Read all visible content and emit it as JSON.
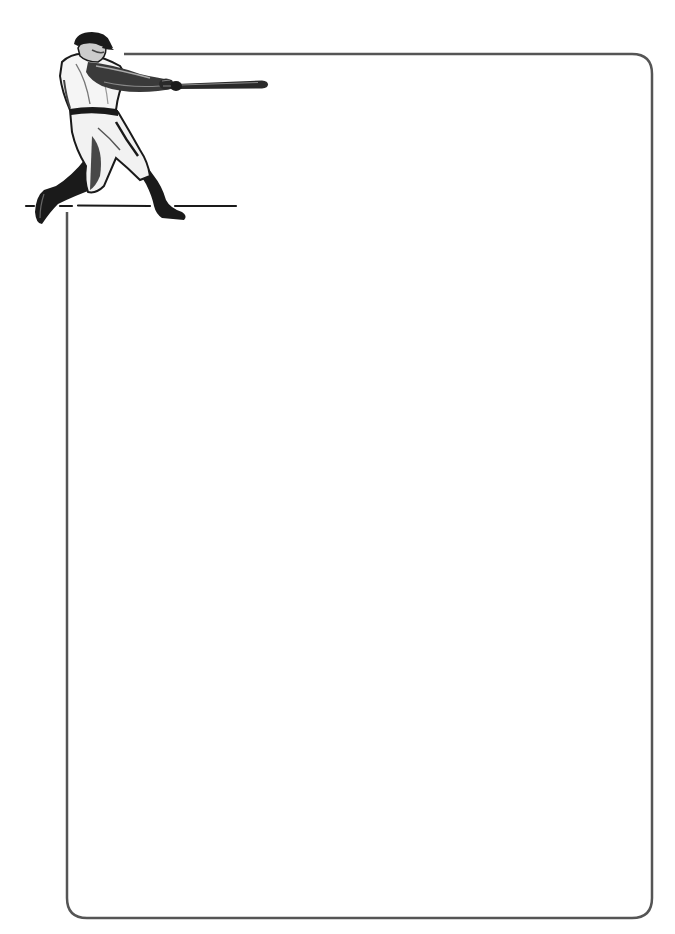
{
  "page": {
    "type": "stationery",
    "theme": "baseball",
    "background_color": "#ffffff"
  },
  "frame": {
    "stroke_color": "#555555",
    "stroke_width": 2.5,
    "corner_radius": 20,
    "left": 67,
    "top": 54,
    "right": 652,
    "bottom": 918
  },
  "illustration": {
    "subject": "baseball-batter-icon",
    "description": "Baseball player mid-swing with bat, standing on ground line",
    "ink_color": "#1a1a1a",
    "ground_line_y": 206
  },
  "writing_area": {
    "content": ""
  }
}
